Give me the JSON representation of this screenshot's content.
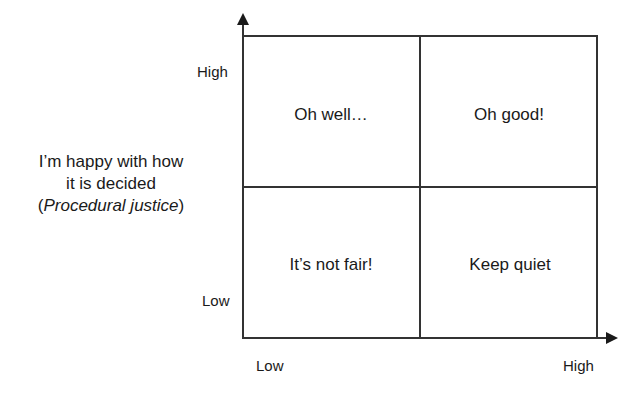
{
  "diagram": {
    "type": "2x2 matrix",
    "y_axis": {
      "label_lines": [
        "I’m happy with how",
        "it is decided"
      ],
      "label_paren_open": "(",
      "label_italic": "Procedural justice",
      "label_paren_close": ")",
      "high": "High",
      "low": "Low"
    },
    "x_axis": {
      "low": "Low",
      "high": "High"
    },
    "quadrants": {
      "top_left": "Oh well…",
      "top_right": "Oh good!",
      "bottom_left": "It’s not fair!",
      "bottom_right": "Keep quiet"
    },
    "colors": {
      "line": "#333333",
      "text": "#1a1a1a",
      "background": "#ffffff"
    }
  }
}
